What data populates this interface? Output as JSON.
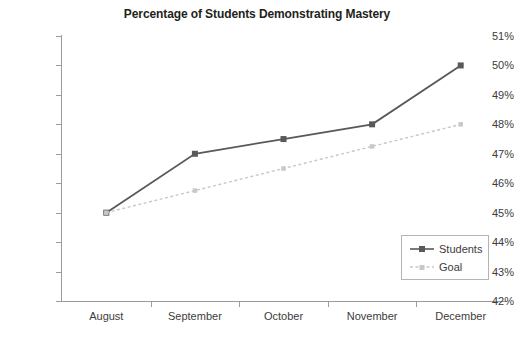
{
  "chart_data": {
    "type": "line",
    "title": "Percentage of Students Demonstrating Mastery",
    "xlabel": "",
    "ylabel": "",
    "categories": [
      "August",
      "September",
      "October",
      "November",
      "December"
    ],
    "series": [
      {
        "name": "Students",
        "values": [
          45,
          47,
          47.5,
          48,
          50
        ],
        "color": "#595959",
        "style": "solid",
        "marker": "square"
      },
      {
        "name": "Goal",
        "values": [
          45,
          45.75,
          46.5,
          47.25,
          48
        ],
        "color": "#c8c8c8",
        "style": "dashed",
        "marker": "square"
      }
    ],
    "ylim": [
      42,
      51
    ],
    "ytick_labels": [
      "51%",
      "50%",
      "49%",
      "48%",
      "47%",
      "46%",
      "45%",
      "44%",
      "43%",
      "42%"
    ],
    "ytick_values": [
      51,
      50,
      49,
      48,
      47,
      46,
      45,
      44,
      43,
      42
    ],
    "grid": false,
    "legend_position": "bottom-right",
    "legend_entries": [
      "Students",
      "Goal"
    ]
  },
  "colors": {
    "axis": "#9b9b9b",
    "text": "#3c3c3b",
    "title": "#231f20",
    "students": "#595959",
    "goal": "#c8c8c8",
    "legend_border": "#b4b4b4",
    "background": "#ffffff"
  }
}
